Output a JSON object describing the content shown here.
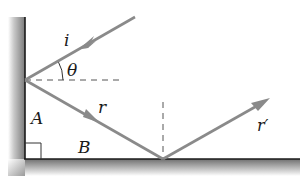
{
  "diagram": {
    "labels": {
      "incident": "i",
      "angle": "θ",
      "reflected_first": "r",
      "reflected_second": "r′",
      "side_a": "A",
      "side_b": "B"
    },
    "colors": {
      "ray": "#8a8a8a",
      "dashed": "#555555",
      "mirror_edge": "#1a1a1a",
      "background": "#ffffff"
    }
  }
}
